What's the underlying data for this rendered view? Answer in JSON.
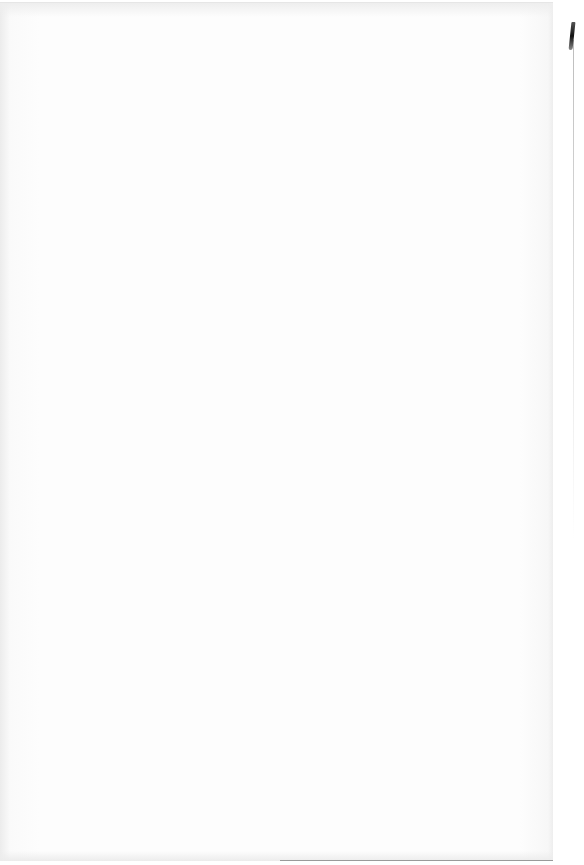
{
  "document": {
    "type": "scanned-page",
    "content": "",
    "bleed_through_text": "",
    "is_blank": true
  }
}
